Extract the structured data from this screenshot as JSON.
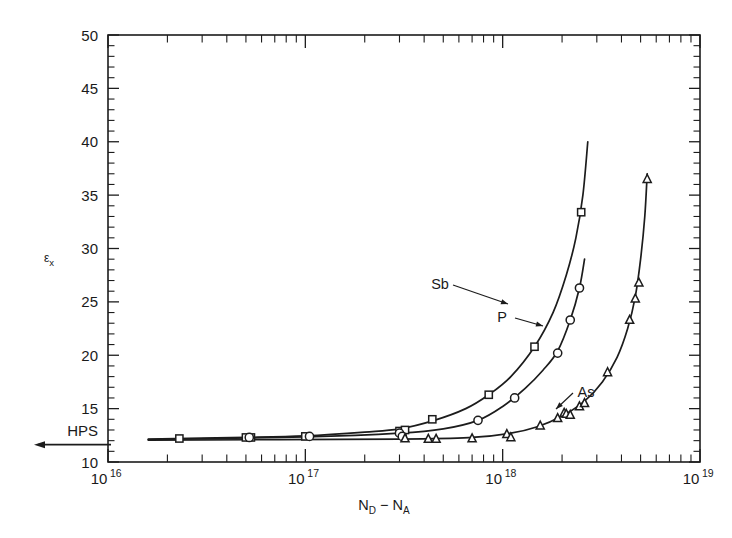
{
  "figure": {
    "background": "#ffffff",
    "ink_color": "#1c1c1c"
  },
  "axes": {
    "y_label_main": "ε",
    "y_label_sub": "x",
    "y_tick_labels": [
      "50",
      "45",
      "40",
      "35",
      "30",
      "25",
      "20",
      "15",
      "10"
    ],
    "y_tick_values": [
      50,
      45,
      40,
      35,
      30,
      25,
      20,
      15,
      10
    ],
    "y_special_label": "HPS",
    "y_special_value": 12,
    "x_label_parts": {
      "n": "N",
      "d_sub": "D",
      "minus": " − ",
      "n2": "N",
      "a_sub": "A"
    },
    "x_tick_labels": [
      "10",
      "10",
      "10",
      "10"
    ],
    "x_tick_exponents": [
      "16",
      "17",
      "18",
      "19"
    ],
    "x_tick_values": [
      1e+16,
      1e+17,
      1e+18,
      1e+19
    ]
  },
  "series_labels": {
    "sb": "Sb",
    "p": "P",
    "as": "As"
  },
  "chart_data": {
    "type": "scatter",
    "title": "",
    "xlabel": "N_D - N_A",
    "ylabel": "ε_x",
    "xscale": "log",
    "yscale": "linear",
    "xlim": [
      1e+16,
      1e+19
    ],
    "ylim": [
      10,
      50
    ],
    "grid": false,
    "legend_position": "inline-annotations",
    "reference_lines": [
      {
        "name": "HPS",
        "axis": "y",
        "value": 12,
        "label": "HPS"
      }
    ],
    "series": [
      {
        "name": "Sb",
        "marker": "square",
        "points": [
          {
            "x": 2.3e+16,
            "y": 12.2
          },
          {
            "x": 5e+16,
            "y": 12.3
          },
          {
            "x": 5.3e+16,
            "y": 12.3
          },
          {
            "x": 1e+17,
            "y": 12.4
          },
          {
            "x": 3e+17,
            "y": 12.9
          },
          {
            "x": 3.2e+17,
            "y": 13.0
          },
          {
            "x": 4.4e+17,
            "y": 14.0
          },
          {
            "x": 8.5e+17,
            "y": 16.3
          },
          {
            "x": 1.45e+18,
            "y": 20.8
          },
          {
            "x": 2.5e+18,
            "y": 33.4
          }
        ],
        "curve": [
          {
            "x": 1.6e+16,
            "y": 12.15
          },
          {
            "x": 5e+16,
            "y": 12.3
          },
          {
            "x": 1e+17,
            "y": 12.45
          },
          {
            "x": 2e+17,
            "y": 12.8
          },
          {
            "x": 3e+17,
            "y": 13.1
          },
          {
            "x": 4.5e+17,
            "y": 13.9
          },
          {
            "x": 6.5e+17,
            "y": 15.0
          },
          {
            "x": 8.5e+17,
            "y": 16.3
          },
          {
            "x": 1.1e+18,
            "y": 18.0
          },
          {
            "x": 1.45e+18,
            "y": 20.8
          },
          {
            "x": 1.8e+18,
            "y": 24.0
          },
          {
            "x": 2.1e+18,
            "y": 27.5
          },
          {
            "x": 2.35e+18,
            "y": 31.0
          },
          {
            "x": 2.55e+18,
            "y": 35.0
          },
          {
            "x": 2.7e+18,
            "y": 40.0
          }
        ]
      },
      {
        "name": "P",
        "marker": "circle",
        "points": [
          {
            "x": 5.2e+16,
            "y": 12.3
          },
          {
            "x": 1.05e+17,
            "y": 12.4
          },
          {
            "x": 3e+17,
            "y": 12.7
          },
          {
            "x": 3.1e+17,
            "y": 12.4
          },
          {
            "x": 7.5e+17,
            "y": 13.9
          },
          {
            "x": 1.15e+18,
            "y": 16.0
          },
          {
            "x": 1.9e+18,
            "y": 20.2
          },
          {
            "x": 2.2e+18,
            "y": 23.3
          },
          {
            "x": 2.45e+18,
            "y": 26.3
          }
        ],
        "curve": [
          {
            "x": 1.6e+16,
            "y": 12.1
          },
          {
            "x": 1e+17,
            "y": 12.35
          },
          {
            "x": 3e+17,
            "y": 12.7
          },
          {
            "x": 5e+17,
            "y": 13.1
          },
          {
            "x": 7.5e+17,
            "y": 13.9
          },
          {
            "x": 1e+18,
            "y": 15.2
          },
          {
            "x": 1.3e+18,
            "y": 16.9
          },
          {
            "x": 1.6e+18,
            "y": 18.6
          },
          {
            "x": 1.9e+18,
            "y": 20.4
          },
          {
            "x": 2.2e+18,
            "y": 23.3
          },
          {
            "x": 2.45e+18,
            "y": 26.3
          },
          {
            "x": 2.6e+18,
            "y": 29.0
          }
        ]
      },
      {
        "name": "As",
        "marker": "triangle",
        "points": [
          {
            "x": 3.2e+17,
            "y": 12.2
          },
          {
            "x": 4.2e+17,
            "y": 12.15
          },
          {
            "x": 4.6e+17,
            "y": 12.15
          },
          {
            "x": 7e+17,
            "y": 12.2
          },
          {
            "x": 1.05e+18,
            "y": 12.6
          },
          {
            "x": 1.1e+18,
            "y": 12.3
          },
          {
            "x": 1.55e+18,
            "y": 13.4
          },
          {
            "x": 1.9e+18,
            "y": 14.1
          },
          {
            "x": 2.05e+18,
            "y": 14.6
          },
          {
            "x": 2.1e+18,
            "y": 14.5
          },
          {
            "x": 2.2e+18,
            "y": 14.4
          },
          {
            "x": 2.45e+18,
            "y": 15.2
          },
          {
            "x": 2.6e+18,
            "y": 15.5
          },
          {
            "x": 3.4e+18,
            "y": 18.4
          },
          {
            "x": 4.4e+18,
            "y": 23.3
          },
          {
            "x": 4.7e+18,
            "y": 25.3
          },
          {
            "x": 4.9e+18,
            "y": 26.8
          },
          {
            "x": 5.4e+18,
            "y": 36.5
          }
        ],
        "curve": [
          {
            "x": 1.6e+16,
            "y": 12.05
          },
          {
            "x": 3e+17,
            "y": 12.15
          },
          {
            "x": 7e+17,
            "y": 12.3
          },
          {
            "x": 1.1e+18,
            "y": 12.7
          },
          {
            "x": 1.5e+18,
            "y": 13.3
          },
          {
            "x": 2e+18,
            "y": 14.3
          },
          {
            "x": 2.6e+18,
            "y": 15.7
          },
          {
            "x": 3.2e+18,
            "y": 17.5
          },
          {
            "x": 3.8e+18,
            "y": 19.8
          },
          {
            "x": 4.3e+18,
            "y": 22.5
          },
          {
            "x": 4.7e+18,
            "y": 25.5
          },
          {
            "x": 5e+18,
            "y": 29.0
          },
          {
            "x": 5.25e+18,
            "y": 33.0
          },
          {
            "x": 5.4e+18,
            "y": 37.0
          }
        ]
      }
    ]
  },
  "annotations": [
    {
      "name": "Sb",
      "label_x": 440,
      "label_y": 289,
      "target_x": 508,
      "target_y": 304
    },
    {
      "name": "P",
      "label_x": 502,
      "label_y": 322,
      "target_x": 543,
      "target_y": 326
    },
    {
      "name": "As",
      "label_x": 586,
      "label_y": 397,
      "target_x": 556,
      "target_y": 409
    }
  ]
}
